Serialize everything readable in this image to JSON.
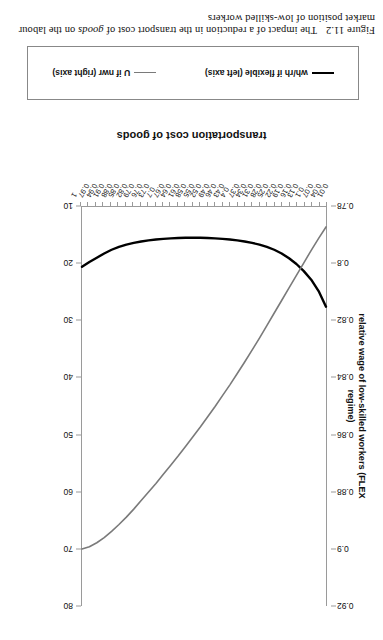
{
  "caption": {
    "number": "Figure 11.2",
    "text_before": "The impact of a reduction in the transport cost of ",
    "text_italic": "goods",
    "text_after": " on the labour market position of low-skilled workers"
  },
  "legend": {
    "entries": [
      {
        "label": "wh/rh if flexible (left axis)",
        "color": "#000000",
        "swatch": "black"
      },
      {
        "label": "U if nwr (right axis)",
        "color": "#7a7a7a",
        "swatch": "gray"
      }
    ]
  },
  "chart_data": {
    "type": "line",
    "title": "",
    "xlabel": "transportation cost of goods",
    "ylabel": "relative wage of low-skilled workers (FLEX regime)",
    "y2label": "unemployment (RWR regime)",
    "grid": false,
    "legend_position": "bottom",
    "xlim": [
      0.01,
      1.0
    ],
    "ylim": [
      0.78,
      0.92
    ],
    "y2lim": [
      10,
      80
    ],
    "ytick_labels": [
      "0.92",
      "0.9",
      "0.88",
      "0.86",
      "0.84",
      "0.82",
      "0.8",
      "0.78"
    ],
    "yticks": [
      0.92,
      0.9,
      0.88,
      0.86,
      0.84,
      0.82,
      0.8,
      0.78
    ],
    "y2tick_labels": [
      "80",
      "70",
      "60",
      "50",
      "40",
      "30",
      "20",
      "10"
    ],
    "y2ticks": [
      80,
      70,
      60,
      50,
      40,
      30,
      20,
      10
    ],
    "xtick_labels": [
      "0.01",
      "0.04",
      "0.07",
      "0.1",
      "0.13",
      "0.16",
      "0.19",
      "0.22",
      "0.25",
      "0.28",
      "0.31",
      "0.34",
      "0.37",
      "0.4",
      "0.43",
      "0.46",
      "0.49",
      "0.52",
      "0.55",
      "0.58",
      "0.61",
      "0.64",
      "0.67",
      "0.7",
      "0.73",
      "0.76",
      "0.79",
      "0.82",
      "0.85",
      "0.88",
      "0.91",
      "0.94",
      "0.97",
      "1"
    ],
    "x": [
      0.01,
      0.04,
      0.07,
      0.1,
      0.13,
      0.16,
      0.19,
      0.22,
      0.25,
      0.28,
      0.31,
      0.34,
      0.37,
      0.4,
      0.43,
      0.46,
      0.49,
      0.52,
      0.55,
      0.58,
      0.61,
      0.64,
      0.67,
      0.7,
      0.73,
      0.76,
      0.79,
      0.82,
      0.85,
      0.88,
      0.91,
      0.94,
      0.97,
      1.0
    ],
    "series": [
      {
        "name": "wh/rh if flexible (left axis)",
        "axis": "left",
        "color": "#000000",
        "width": 2.4,
        "values": [
          0.815,
          0.8095,
          0.8055,
          0.8025,
          0.8,
          0.798,
          0.7963,
          0.795,
          0.794,
          0.7932,
          0.7926,
          0.7921,
          0.7917,
          0.7914,
          0.7912,
          0.791,
          0.7909,
          0.7908,
          0.7908,
          0.7908,
          0.7909,
          0.791,
          0.7912,
          0.7914,
          0.7917,
          0.7921,
          0.7926,
          0.7932,
          0.794,
          0.795,
          0.7963,
          0.7978,
          0.7993,
          0.801
        ]
      },
      {
        "name": "U if nwr (right axis)",
        "axis": "right",
        "color": "#7a7a7a",
        "width": 1.6,
        "values": [
          13.5,
          15.5,
          17.6,
          19.8,
          22.0,
          24.2,
          26.4,
          28.6,
          30.8,
          33.0,
          35.1,
          37.2,
          39.2,
          41.2,
          43.1,
          45.0,
          46.8,
          48.6,
          50.3,
          52.0,
          53.7,
          55.3,
          56.9,
          58.5,
          60.0,
          61.5,
          63.0,
          64.4,
          65.7,
          66.9,
          68.0,
          68.9,
          69.6,
          70.0
        ]
      }
    ]
  }
}
